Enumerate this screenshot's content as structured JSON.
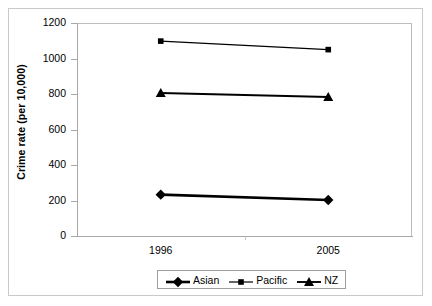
{
  "chart_data": {
    "type": "line",
    "title": "",
    "xlabel": "",
    "ylabel": "Crime rate (per 10,000)",
    "categories": [
      "1996",
      "2005"
    ],
    "x": [
      1996,
      2005
    ],
    "series": [
      {
        "name": "Asian",
        "values": [
          233,
          203
        ],
        "marker": "diamond",
        "color": "#000000",
        "line_width": 2.6
      },
      {
        "name": "Pacific",
        "values": [
          1098,
          1050
        ],
        "marker": "square",
        "color": "#000000",
        "line_width": 1.2
      },
      {
        "name": "NZ",
        "values": [
          806,
          783
        ],
        "marker": "triangle",
        "color": "#000000",
        "line_width": 1.9
      }
    ],
    "ylim": [
      0,
      1200
    ],
    "ytick_values": [
      0,
      200,
      400,
      600,
      800,
      1000,
      1200
    ],
    "ytick_labels": [
      "0",
      "200",
      "400",
      "600",
      "800",
      "1000",
      "1200"
    ],
    "xtick_labels": [
      "1996",
      "2005"
    ],
    "grid": false,
    "legend_position": "bottom",
    "legend_entries": [
      "Asian",
      "Pacific",
      "NZ"
    ],
    "axis_color": "#a8a8a8",
    "frame_color": "#c9c9c9",
    "background": "#ffffff"
  }
}
